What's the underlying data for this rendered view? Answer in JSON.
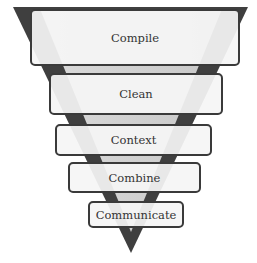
{
  "diagram": {
    "type": "inverted-funnel",
    "colors": {
      "funnel_dark": "#3f3f3f",
      "funnel_light": "#d9d9d9",
      "box_fill": "#f4f4f4",
      "box_border": "#3a3a3a",
      "text": "#333333"
    },
    "stages": [
      {
        "label": "Compile"
      },
      {
        "label": "Clean"
      },
      {
        "label": "Context"
      },
      {
        "label": "Combine"
      },
      {
        "label": "Communicate"
      }
    ]
  }
}
